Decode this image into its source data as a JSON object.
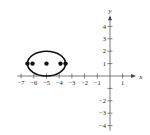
{
  "chart_data": {
    "type": "scatter",
    "title": "",
    "xlabel": "x",
    "ylabel": "y",
    "xlim": [
      -7,
      1
    ],
    "ylim": [
      -4,
      4
    ],
    "grid": false,
    "x_ticks": [
      -7,
      -6,
      -5,
      -4,
      -3,
      -2,
      -1,
      1
    ],
    "y_ticks": [
      4,
      3,
      2,
      1,
      -2,
      -3,
      -4
    ],
    "x_tick_labels": [
      "−7",
      "−6",
      "−5",
      "−4",
      "−3",
      "−2",
      "−1",
      "1"
    ],
    "y_tick_labels": [
      "4",
      "3",
      "2",
      "1",
      "−2",
      "−3",
      "−4"
    ],
    "ellipse": {
      "center": [
        -5,
        1
      ],
      "semi_major_horizontal": 1.5,
      "semi_minor_vertical": 1
    },
    "points": [
      {
        "label": "vertex-left",
        "x": -6.5,
        "y": 1
      },
      {
        "label": "focus-left",
        "x": -6.1,
        "y": 1
      },
      {
        "label": "center",
        "x": -5,
        "y": 1
      },
      {
        "label": "focus-right",
        "x": -3.9,
        "y": 1
      },
      {
        "label": "vertex-right",
        "x": -3.5,
        "y": 1
      }
    ]
  },
  "axes": {
    "x_label": "x",
    "y_label": "y"
  }
}
